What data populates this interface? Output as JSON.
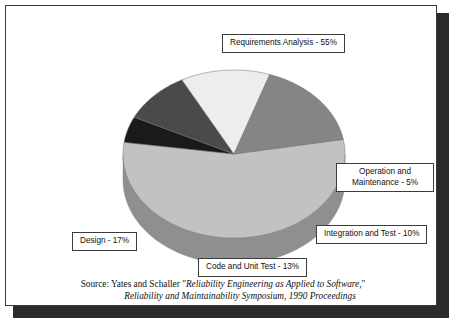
{
  "figure": {
    "source_prefix": "Source:  Yates and Schaller ",
    "source_quote_open": "\"",
    "source_title_1": "Reliability Engineering as Applied to Software,",
    "source_quote_close": "\"",
    "source_title_2": "Reliability and Maintainability Symposium,  1990 Proceedings"
  },
  "labels": {
    "requirements": "Requirements Analysis - 55%",
    "operation": "Operation and Maintenance -  5%",
    "integration": "Integration and Test - 10%",
    "design": "Design - 17%",
    "code": "Code and Unit Test - 13%"
  },
  "chart_data": {
    "type": "pie",
    "title": "",
    "legend_position": "callout-boxes",
    "grid": false,
    "three_d": true,
    "categories": [
      "Requirements Analysis",
      "Operation and Maintenance",
      "Integration and Test",
      "Code and Unit Test",
      "Design"
    ],
    "values": [
      55,
      5,
      10,
      13,
      17
    ],
    "unit": "%",
    "total": 100,
    "colors": [
      "#c2c2c2",
      "#1a1a1a",
      "#4a4a4a",
      "#ededed",
      "#858585"
    ],
    "side_colors": [
      "#8f8f8f",
      "#101010",
      "#333333",
      "#a8a8a8",
      "#5e5e5e"
    ],
    "slices": [
      {
        "label": "Requirements Analysis",
        "value": 55,
        "color": "#c2c2c2"
      },
      {
        "label": "Operation and Maintenance",
        "value": 5,
        "color": "#1a1a1a"
      },
      {
        "label": "Integration and Test",
        "value": 10,
        "color": "#4a4a4a"
      },
      {
        "label": "Code and Unit Test",
        "value": 13,
        "color": "#ededed"
      },
      {
        "label": "Design",
        "value": 17,
        "color": "#858585"
      }
    ]
  }
}
